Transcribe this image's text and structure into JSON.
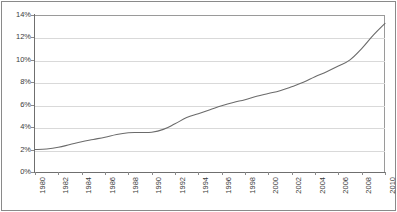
{
  "chart_data": {
    "type": "line",
    "title": "",
    "subtitle": "",
    "xlabel": "",
    "ylabel": "",
    "grid": "horizontal",
    "legend": "none",
    "ylim": [
      0,
      14
    ],
    "ytick_labels": [
      "14%",
      "12%",
      "10%",
      "8%",
      "6%",
      "4%",
      "2%",
      "0%"
    ],
    "ytick_values": [
      14,
      12,
      10,
      8,
      6,
      4,
      2,
      0
    ],
    "xlim": [
      1980,
      2010
    ],
    "xtick_labels": [
      "1980",
      "1982",
      "1984",
      "1986",
      "1988",
      "1990",
      "1992",
      "1994",
      "1996",
      "1998",
      "2000",
      "2002",
      "2004",
      "2006",
      "2008",
      "2010"
    ],
    "x": [
      1980,
      1981,
      1982,
      1983,
      1984,
      1985,
      1986,
      1987,
      1988,
      1989,
      1990,
      1991,
      1992,
      1993,
      1994,
      1995,
      1996,
      1997,
      1998,
      1999,
      2000,
      2001,
      2002,
      2003,
      2004,
      2005,
      2006,
      2007,
      2008,
      2009,
      2010
    ],
    "series": [
      {
        "name": "",
        "color": "#6b6b6b",
        "values": [
          2.0,
          2.05,
          2.2,
          2.45,
          2.7,
          2.9,
          3.1,
          3.35,
          3.5,
          3.52,
          3.55,
          3.8,
          4.3,
          4.85,
          5.2,
          5.55,
          5.9,
          6.2,
          6.45,
          6.75,
          7.0,
          7.25,
          7.6,
          8.0,
          8.5,
          8.95,
          9.45,
          10.0,
          11.0,
          12.2,
          13.25
        ]
      }
    ],
    "annotations": [],
    "colors": {
      "line": "#6b6b6b",
      "gridline": "#d9d9d9",
      "axis": "#6f6f6f",
      "frame": "#8a8a8a",
      "tick_text": "#3a3a3a",
      "background": "#ffffff"
    }
  }
}
